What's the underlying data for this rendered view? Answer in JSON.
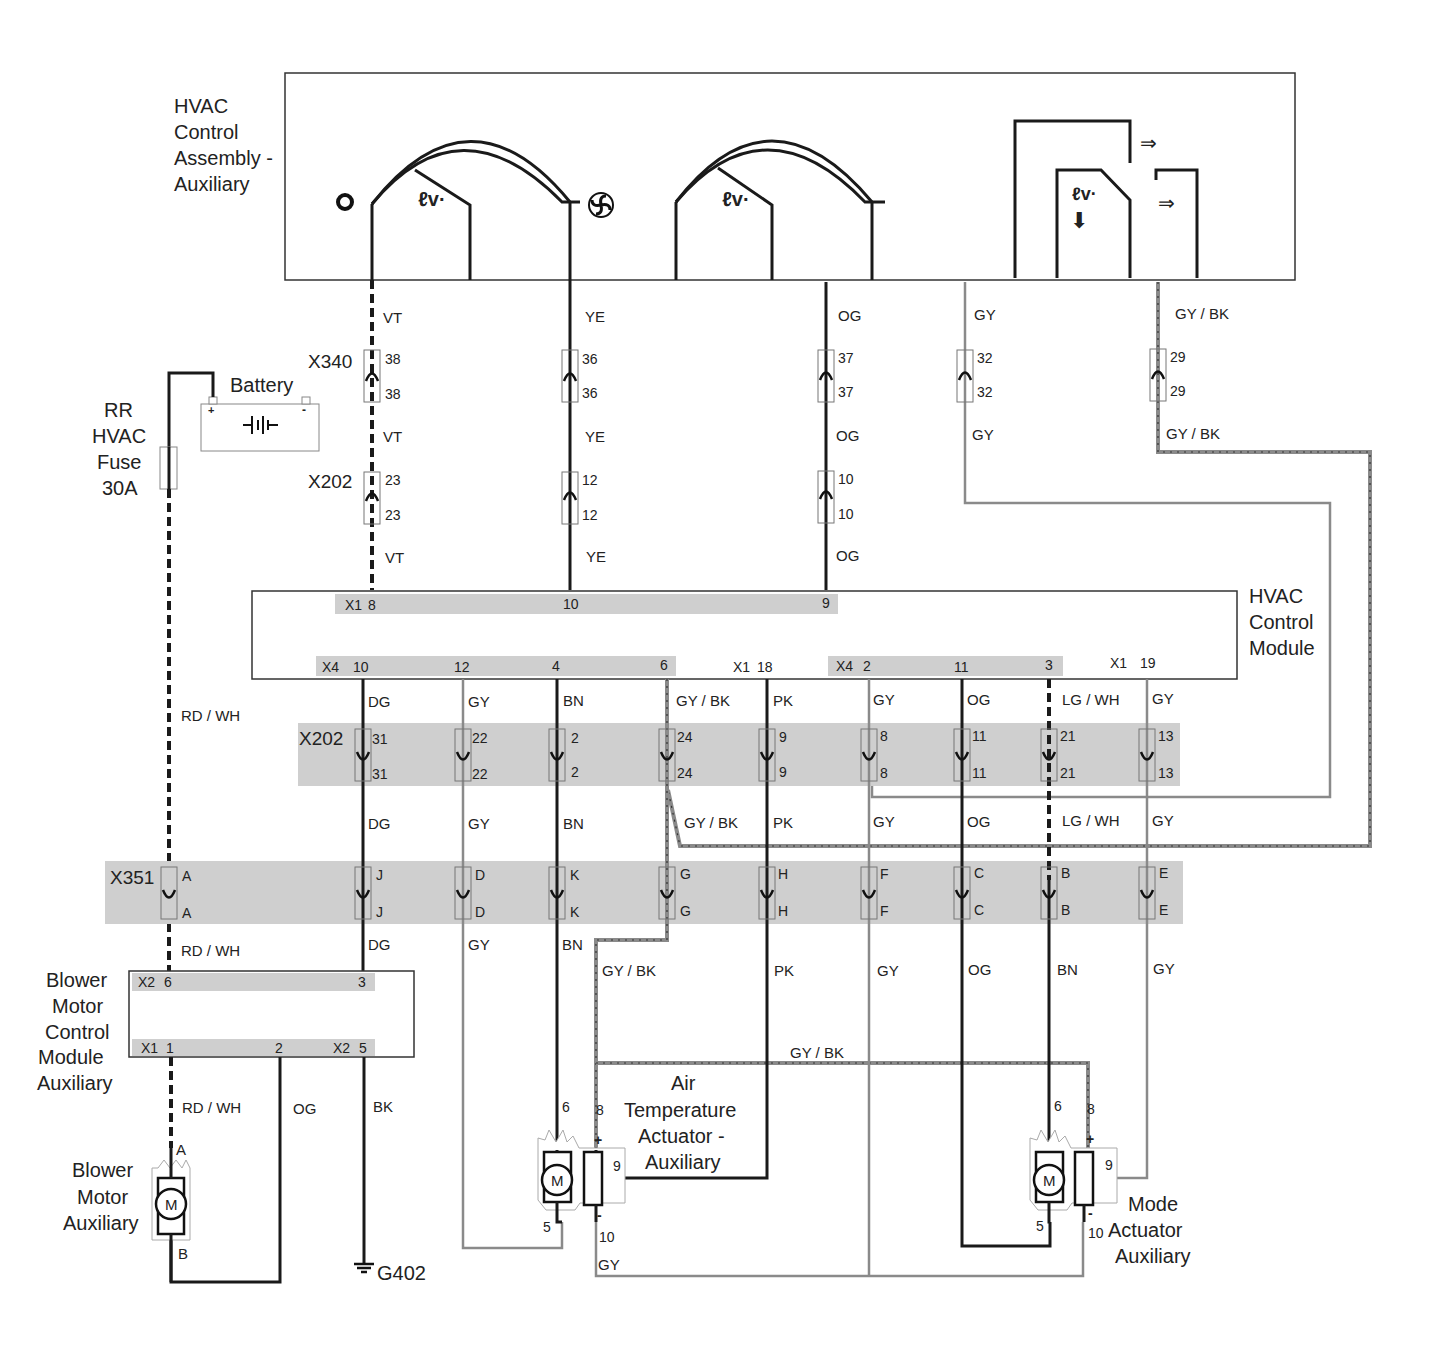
{
  "components": {
    "hvac_control_assembly": {
      "line1": "HVAC",
      "line2": "Control",
      "line3": "Assembly -",
      "line4": "Auxiliary"
    },
    "battery": {
      "label": "Battery",
      "plus": "+",
      "minus": "-"
    },
    "fuse": {
      "line1": "RR",
      "line2": "HVAC",
      "line3": "Fuse",
      "line4": "30A"
    },
    "hvac_control_module": {
      "line1": "HVAC",
      "line2": "Control",
      "line3": "Module"
    },
    "blower_motor_control_module": {
      "line1": "Blower",
      "line2": "Motor",
      "line3": "Control",
      "line4": "Module",
      "line5": "Auxiliary"
    },
    "blower_motor": {
      "line1": "Blower",
      "line2": "Motor",
      "line3": "Auxiliary",
      "symbol": "M",
      "pin_a": "A",
      "pin_b": "B"
    },
    "air_temp_actuator": {
      "line1": "Air",
      "line2": "Temperature",
      "line3": "Actuator -",
      "line4": "Auxiliary",
      "symbol": "M",
      "pins": {
        "p6": "6",
        "p8": "8",
        "p9": "9",
        "p5": "5",
        "p10": "10",
        "plus": "+",
        "minus": "-"
      }
    },
    "mode_actuator": {
      "line1": "Mode",
      "line2": "Actuator",
      "line3": "Auxiliary",
      "symbol": "M",
      "pins": {
        "p6": "6",
        "p8": "8",
        "p9": "9",
        "p5": "5",
        "p10": "10",
        "plus": "+",
        "minus": "-"
      }
    },
    "ground": {
      "label": "G402"
    }
  },
  "connectors": {
    "x340": {
      "name": "X340",
      "pins": [
        {
          "top": "38",
          "bottom": "38"
        },
        {
          "top": "36",
          "bottom": "36"
        },
        {
          "top": "37",
          "bottom": "37"
        },
        {
          "top": "32",
          "bottom": "32"
        },
        {
          "top": "29",
          "bottom": "29"
        }
      ]
    },
    "x202_upper": {
      "name": "X202",
      "pins": [
        {
          "top": "23",
          "bottom": "23"
        },
        {
          "top": "12",
          "bottom": "12"
        },
        {
          "top": "10",
          "bottom": "10"
        }
      ]
    },
    "x202_lower": {
      "name": "X202",
      "pins": [
        {
          "top": "31",
          "bottom": "31"
        },
        {
          "top": "22",
          "bottom": "22"
        },
        {
          "top": "2",
          "bottom": "2"
        },
        {
          "top": "24",
          "bottom": "24"
        },
        {
          "top": "9",
          "bottom": "9"
        },
        {
          "top": "8",
          "bottom": "8"
        },
        {
          "top": "11",
          "bottom": "11"
        },
        {
          "top": "21",
          "bottom": "21"
        },
        {
          "top": "13",
          "bottom": "13"
        }
      ]
    },
    "x351": {
      "name": "X351",
      "pins": [
        {
          "top": "A",
          "bottom": "A"
        },
        {
          "top": "J",
          "bottom": "J"
        },
        {
          "top": "D",
          "bottom": "D"
        },
        {
          "top": "K",
          "bottom": "K"
        },
        {
          "top": "G",
          "bottom": "G"
        },
        {
          "top": "H",
          "bottom": "H"
        },
        {
          "top": "F",
          "bottom": "F"
        },
        {
          "top": "C",
          "bottom": "C"
        },
        {
          "top": "B",
          "bottom": "B"
        },
        {
          "top": "E",
          "bottom": "E"
        }
      ]
    }
  },
  "module_pins": {
    "hvac_top": {
      "x1": "X1",
      "p8": "8",
      "p10": "10",
      "p9": "9"
    },
    "hvac_bottom": {
      "x4a": "X4",
      "p10": "10",
      "p12": "12",
      "p4": "4",
      "p6": "6",
      "x1a": "X1",
      "p18": "18",
      "x4b": "X4",
      "p2": "2",
      "p11": "11",
      "p3": "3",
      "x1b": "X1",
      "p19": "19"
    },
    "bmcm_top": {
      "x2": "X2",
      "p6": "6",
      "p3": "3"
    },
    "bmcm_bottom": {
      "x1": "X1",
      "p1": "1",
      "p2": "2",
      "x2": "X2",
      "p5": "5"
    }
  },
  "wire_labels": {
    "vt": "VT",
    "ye": "YE",
    "og": "OG",
    "gy": "GY",
    "gybk": "GY / BK",
    "rdwh": "RD / WH",
    "dg": "DG",
    "bn": "BN",
    "pk": "PK",
    "lgwh": "LG / WH",
    "bk": "BK"
  },
  "colors": {
    "wire_dark": "#1a1a1a",
    "wire_gray": "#8a8a8a",
    "band": "#cfcfcf"
  }
}
